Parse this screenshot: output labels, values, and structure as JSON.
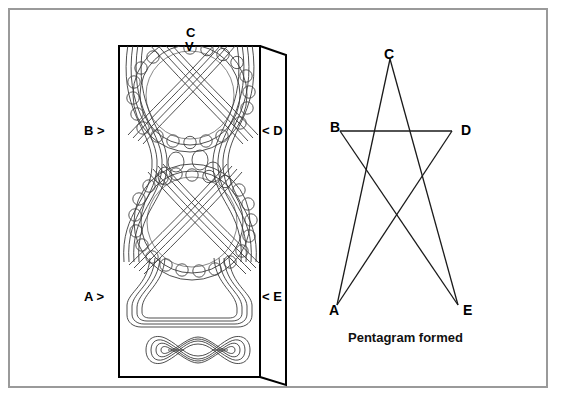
{
  "figure": {
    "background_color": "#ffffff",
    "border_color": "#9a9a9a",
    "ink_color": "#1a1a1a"
  },
  "left_panel": {
    "name": "celtic-knotwork-panel",
    "description": "Rectangular knotwork panel drawn in 3D perspective with a front face and a right side face",
    "markers": [
      {
        "id": "C",
        "label": "C",
        "arrow": "V",
        "position": "top",
        "points_to": "down"
      },
      {
        "id": "B",
        "label": "B",
        "arrow": ">",
        "position": "left-middle",
        "points_to": "right"
      },
      {
        "id": "D",
        "label": "D",
        "arrow": "<",
        "position": "right-middle",
        "points_to": "left"
      },
      {
        "id": "A",
        "label": "A",
        "arrow": ">",
        "position": "left-lower",
        "points_to": "right"
      },
      {
        "id": "E",
        "label": "E",
        "arrow": "<",
        "position": "right-lower",
        "points_to": "left"
      }
    ],
    "marker_text": {
      "C": "C",
      "C_arrow": "V",
      "B": "B >",
      "D": "< D",
      "A": "A >",
      "E": "< E"
    }
  },
  "right_panel": {
    "name": "pentagram-diagram",
    "caption": "Pentagram formed",
    "vertices": [
      {
        "label": "A",
        "x": 337,
        "y": 305,
        "label_x": 329,
        "label_y": 303
      },
      {
        "label": "B",
        "x": 340,
        "y": 131,
        "label_x": 330,
        "label_y": 120
      },
      {
        "label": "C",
        "x": 390,
        "y": 59,
        "label_x": 384,
        "label_y": 47
      },
      {
        "label": "D",
        "x": 452,
        "y": 131,
        "label_x": 461,
        "label_y": 123
      },
      {
        "label": "E",
        "x": 458,
        "y": 305,
        "label_x": 463,
        "label_y": 303
      }
    ],
    "edges": [
      [
        "A",
        "C"
      ],
      [
        "C",
        "E"
      ],
      [
        "E",
        "B"
      ],
      [
        "B",
        "D"
      ],
      [
        "D",
        "A"
      ]
    ]
  },
  "chart_data": {
    "type": "diagram",
    "title": "Pentagram formed",
    "node_labels": [
      "A",
      "B",
      "C",
      "D",
      "E"
    ],
    "connections": "A-C, C-E, E-B, B-D, D-A",
    "note": "Five marker points on the knotwork panel connect to form a pentagram"
  }
}
